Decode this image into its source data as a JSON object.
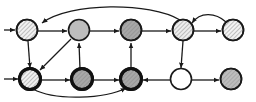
{
  "figure": {
    "type": "directed-graph",
    "title": "",
    "width": 256,
    "height": 102,
    "background_color": "#ffffff"
  },
  "styles": {
    "node_radius": 10.5,
    "node_stroke_color": "#1a1a1a",
    "node_stroke_width_normal": 1.6,
    "node_stroke_width_bold": 3.0,
    "fill_white": "#ffffff",
    "fill_light_gray": "#e8e8e8",
    "fill_mid_gray": "#bdbdbd",
    "fill_dark_gray": "#a0a0a0",
    "hatch_color": "#6e6e6e",
    "edge_color": "#1a1a1a",
    "edge_width": 1.3,
    "arrow_size": 4.6
  },
  "nodes": [
    {
      "id": "T1",
      "label": "",
      "row": "top",
      "col": 1,
      "cx": 27,
      "cy": 30,
      "fill": "#f0f0f0",
      "hatched": true,
      "bold_border": false
    },
    {
      "id": "T2",
      "label": "",
      "row": "top",
      "col": 2,
      "cx": 79,
      "cy": 30,
      "fill": "#bdbdbd",
      "hatched": false,
      "bold_border": false
    },
    {
      "id": "T3",
      "label": "",
      "row": "top",
      "col": 3,
      "cx": 131,
      "cy": 30,
      "fill": "#a8a8a8",
      "hatched": true,
      "bold_border": false
    },
    {
      "id": "T4",
      "label": "",
      "row": "top",
      "col": 4,
      "cx": 183,
      "cy": 30,
      "fill": "#ededed",
      "hatched": true,
      "bold_border": false
    },
    {
      "id": "T5",
      "label": "",
      "row": "top",
      "col": 5,
      "cx": 233,
      "cy": 30,
      "fill": "#f2f2f2",
      "hatched": true,
      "bold_border": false
    },
    {
      "id": "B1",
      "label": "",
      "row": "bottom",
      "col": 1,
      "cx": 30,
      "cy": 79,
      "fill": "#f0f0f0",
      "hatched": true,
      "bold_border": true
    },
    {
      "id": "B2",
      "label": "",
      "row": "bottom",
      "col": 2,
      "cx": 82,
      "cy": 79,
      "fill": "#a8a8a8",
      "hatched": true,
      "bold_border": true
    },
    {
      "id": "B3",
      "label": "",
      "row": "bottom",
      "col": 3,
      "cx": 131,
      "cy": 79,
      "fill": "#a8a8a8",
      "hatched": true,
      "bold_border": true
    },
    {
      "id": "B4",
      "label": "",
      "row": "bottom",
      "col": 4,
      "cx": 181,
      "cy": 79,
      "fill": "#ffffff",
      "hatched": false,
      "bold_border": false
    },
    {
      "id": "B5",
      "label": "",
      "row": "bottom",
      "col": 5,
      "cx": 231,
      "cy": 79,
      "fill": "#bdbdbd",
      "hatched": true,
      "bold_border": false
    }
  ],
  "edges": [
    {
      "id": "E1",
      "from": "external-left-top",
      "to": "T1",
      "shape": "straight",
      "label": ""
    },
    {
      "id": "E2",
      "from": "T1",
      "to": "T2",
      "shape": "straight",
      "label": ""
    },
    {
      "id": "E3",
      "from": "T2",
      "to": "T3",
      "shape": "straight",
      "label": ""
    },
    {
      "id": "E4",
      "from": "T3",
      "to": "T4",
      "shape": "straight",
      "label": ""
    },
    {
      "id": "E5",
      "from": "T4",
      "to": "T5",
      "shape": "straight",
      "label": ""
    },
    {
      "id": "E6",
      "from": "T4",
      "to": "T1",
      "shape": "arc-above",
      "label": ""
    },
    {
      "id": "E7",
      "from": "T5",
      "to": "T4",
      "shape": "arc-above-short",
      "label": ""
    },
    {
      "id": "E8",
      "from": "T1",
      "to": "B1",
      "shape": "vertical",
      "label": ""
    },
    {
      "id": "E9",
      "from": "T3",
      "to": "B3",
      "shape": "vertical",
      "label": ""
    },
    {
      "id": "E10",
      "from": "T4",
      "to": "B4",
      "shape": "vertical",
      "label": ""
    },
    {
      "id": "E11",
      "from": "B2",
      "to": "T2",
      "shape": "vertical-up",
      "label": ""
    },
    {
      "id": "E12",
      "from": "T2",
      "to": "B1",
      "shape": "diagonal",
      "label": ""
    },
    {
      "id": "E13",
      "from": "external-left-bottom",
      "to": "B1",
      "shape": "straight",
      "label": ""
    },
    {
      "id": "E14",
      "from": "B1",
      "to": "B2",
      "shape": "straight",
      "label": ""
    },
    {
      "id": "E15",
      "from": "B2",
      "to": "B3",
      "shape": "straight",
      "label": ""
    },
    {
      "id": "E16",
      "from": "B4",
      "to": "B3",
      "shape": "straight-left",
      "label": ""
    },
    {
      "id": "E17",
      "from": "B4",
      "to": "B5",
      "shape": "straight",
      "label": ""
    },
    {
      "id": "E18",
      "from": "B1",
      "to": "B3",
      "shape": "arc-below",
      "label": ""
    }
  ],
  "counts": {
    "node_count": 10,
    "edge_count": 18,
    "top_row_nodes": 5,
    "bottom_row_nodes": 5
  }
}
